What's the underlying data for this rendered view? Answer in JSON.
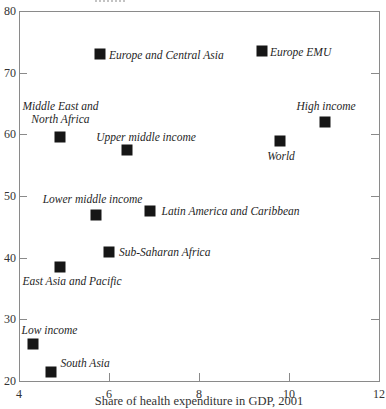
{
  "chart_data": {
    "type": "scatter",
    "title": "",
    "xlabel": "Share of health expenditure in GDP, 2001",
    "ylabel": "",
    "xlim": [
      4,
      12
    ],
    "ylim": [
      20,
      80
    ],
    "x_ticks": [
      4,
      6,
      8,
      10,
      12
    ],
    "y_ticks": [
      20,
      30,
      40,
      50,
      60,
      70,
      80
    ],
    "grid": false,
    "legend": "none",
    "marker_shape": "filled-square",
    "marker_color": "#161616",
    "axis_color": "#8a8a8a",
    "text_color": "#333333",
    "points": [
      {
        "label": "Low income",
        "x": 4.3,
        "y": 26,
        "anchor": "al",
        "dx": -11,
        "dy": -7
      },
      {
        "label": "South Asia",
        "x": 4.7,
        "y": 21.5,
        "anchor": "al",
        "dx": 10,
        "dy": -2
      },
      {
        "label": "East Asia and Pacific",
        "x": 4.9,
        "y": 38.5,
        "anchor": "bl",
        "dx": -37,
        "dy": 8
      },
      {
        "label": "Middle East and\nNorth Africa",
        "x": 4.9,
        "y": 59.5,
        "anchor": "a",
        "dx": 1,
        "dy": -11
      },
      {
        "label": "Lower middle income",
        "x": 5.7,
        "y": 47,
        "anchor": "a",
        "dx": -3,
        "dy": -9
      },
      {
        "label": "Europe and Central Asia",
        "x": 5.8,
        "y": 73,
        "anchor": "r",
        "dx": 9,
        "dy": 1
      },
      {
        "label": "Sub-Saharan Africa",
        "x": 6.0,
        "y": 41,
        "anchor": "r",
        "dx": 10,
        "dy": 0
      },
      {
        "label": "Upper middle income",
        "x": 6.4,
        "y": 57.5,
        "anchor": "a",
        "dx": 19,
        "dy": -6
      },
      {
        "label": "Latin America and Caribbean",
        "x": 6.9,
        "y": 47.5,
        "anchor": "r",
        "dx": 12,
        "dy": 0
      },
      {
        "label": "Europe EMU",
        "x": 9.4,
        "y": 73.5,
        "anchor": "r",
        "dx": 8,
        "dy": 1
      },
      {
        "label": "World",
        "x": 9.8,
        "y": 59,
        "anchor": "b",
        "dx": 1,
        "dy": 9
      },
      {
        "label": "High income",
        "x": 10.8,
        "y": 62,
        "anchor": "a",
        "dx": 1,
        "dy": -9
      }
    ]
  }
}
